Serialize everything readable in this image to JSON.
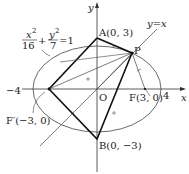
{
  "diagram": {
    "equation": {
      "x_num": "x",
      "x_exp": "2",
      "x_den": "16",
      "plus": "+",
      "y_num": "y",
      "y_exp": "2",
      "y_den": "7",
      "eq": "=1"
    },
    "axes": {
      "x_label": "x",
      "y_label": "y",
      "origin_label": "O"
    },
    "line_label": "y=x",
    "points": {
      "A": "A(0, 3)",
      "B": "B(0, −3)",
      "F": "F(3, 0)",
      "F_prime": "F′(−3, 0)",
      "P": "P"
    },
    "ticks": {
      "neg4": "−4",
      "pos4": "4"
    },
    "colors": {
      "stroke": "#222222",
      "thin": "#444444"
    }
  }
}
